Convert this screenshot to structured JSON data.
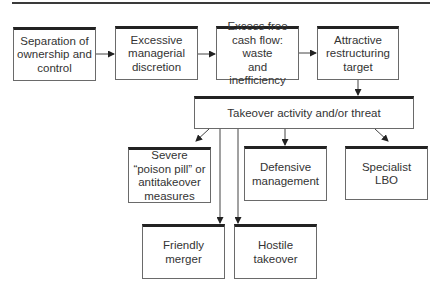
{
  "diagram": {
    "type": "flowchart",
    "row1": [
      {
        "id": "separation",
        "label": "Separation of\nownership and\ncontrol"
      },
      {
        "id": "discretion",
        "label": "Excessive\nmanagerial\ndiscretion"
      },
      {
        "id": "free-cash-flow",
        "label": "Excess free\ncash flow: waste\nand inefficiency"
      },
      {
        "id": "restructuring-target",
        "label": "Attractive\nrestructuring\ntarget"
      }
    ],
    "center": {
      "id": "takeover-activity",
      "label": "Takeover activity and/or threat"
    },
    "row2": [
      {
        "id": "poison-pill",
        "label": "Severe\n“poison pill” or\nantitakeover\nmeasures"
      },
      {
        "id": "defensive-management",
        "label": "Defensive\nmanagement"
      },
      {
        "id": "specialist-lbo",
        "label": "Specialist LBO"
      }
    ],
    "row3": [
      {
        "id": "friendly-merger",
        "label": "Friendly merger"
      },
      {
        "id": "hostile-takeover",
        "label": "Hostile takeover"
      }
    ],
    "edges": [
      [
        "separation",
        "discretion"
      ],
      [
        "discretion",
        "free-cash-flow"
      ],
      [
        "free-cash-flow",
        "restructuring-target"
      ],
      [
        "restructuring-target",
        "takeover-activity"
      ],
      [
        "takeover-activity",
        "poison-pill"
      ],
      [
        "takeover-activity",
        "defensive-management"
      ],
      [
        "takeover-activity",
        "specialist-lbo"
      ],
      [
        "takeover-activity",
        "friendly-merger"
      ],
      [
        "takeover-activity",
        "hostile-takeover"
      ]
    ]
  }
}
